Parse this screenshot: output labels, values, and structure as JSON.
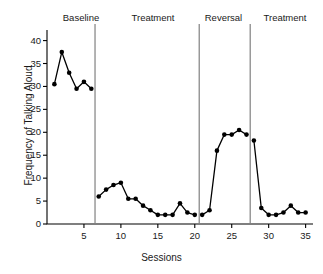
{
  "chart_data": {
    "type": "line",
    "title": "",
    "xlabel": "Sessions",
    "ylabel": "Frequency of Talking Aloud",
    "xlim": [
      0,
      36
    ],
    "ylim": [
      0,
      41
    ],
    "xticks": [
      5,
      10,
      15,
      20,
      25,
      30,
      35
    ],
    "yticks": [
      0,
      5,
      10,
      15,
      20,
      25,
      30,
      35,
      40
    ],
    "grid": false,
    "legend": "none",
    "marker": "filled-circle",
    "line_color": "#000000",
    "marker_color": "#000000",
    "phase_line_color": "#808080",
    "phases": [
      {
        "label": "Baseline",
        "start": 1,
        "end": 6,
        "divider_after": 6.5
      },
      {
        "label": "Treatment",
        "start": 7,
        "end": 20,
        "divider_after": 20.6
      },
      {
        "label": "Reversal",
        "start": 21,
        "end": 27,
        "divider_after": 27.5
      },
      {
        "label": "Treatment",
        "start": 28,
        "end": 35,
        "divider_after": null
      }
    ],
    "series": [
      {
        "name": "Frequency of Talking Aloud",
        "x": [
          1,
          2,
          3,
          4,
          5,
          6,
          7,
          8,
          9,
          10,
          11,
          12,
          13,
          14,
          15,
          16,
          17,
          18,
          19,
          20,
          21,
          22,
          23,
          24,
          25,
          26,
          27,
          28,
          29,
          30,
          31,
          32,
          33,
          34,
          35
        ],
        "values": [
          30.5,
          37.5,
          33.0,
          29.5,
          31.0,
          29.5,
          6.0,
          7.5,
          8.5,
          9.0,
          5.5,
          5.5,
          4.0,
          3.0,
          2.0,
          2.0,
          2.0,
          4.5,
          2.5,
          2.0,
          2.0,
          3.0,
          16.0,
          19.5,
          19.5,
          20.5,
          19.5,
          18.2,
          3.5,
          2.0,
          2.0,
          2.5,
          4.0,
          2.5,
          2.5
        ]
      }
    ]
  },
  "axis": {
    "xlabel": "Sessions",
    "ylabel": "Frequency of Talking Aloud"
  },
  "phase_labels": {
    "baseline": "Baseline",
    "treatment_1": "Treatment",
    "reversal": "Reversal",
    "treatment_2": "Treatment"
  }
}
